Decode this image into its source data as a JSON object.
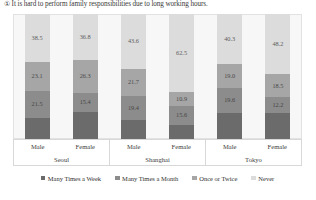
{
  "figure": {
    "title": "① It is hard to perform family responsibilities due to long working hours."
  },
  "legend": {
    "items": [
      {
        "label": "Many Times a Week",
        "color": "#6b6b6b",
        "icon": "square-swatch-icon"
      },
      {
        "label": "Many Times a Month",
        "color": "#8c8c8c",
        "icon": "square-swatch-icon"
      },
      {
        "label": "Once or Twice",
        "color": "#a6a6a6",
        "icon": "square-swatch-icon"
      },
      {
        "label": "Never",
        "color": "#dcdcdc",
        "icon": "square-swatch-icon"
      }
    ]
  },
  "axis": {
    "groups": [
      {
        "city": "Seoul",
        "sexes": [
          "Male",
          "Female"
        ]
      },
      {
        "city": "Shanghai",
        "sexes": [
          "Male",
          "Female"
        ]
      },
      {
        "city": "Tokyo",
        "sexes": [
          "Male",
          "Female"
        ]
      }
    ]
  },
  "chart_data": {
    "type": "bar",
    "title": "① It is hard to perform family responsibilities due to long working hours.",
    "subtype": "100% stacked bar",
    "xlabel": "",
    "ylabel": "",
    "ylim": [
      0,
      100
    ],
    "grid": false,
    "legend_position": "bottom",
    "categories": [
      "Seoul Male",
      "Seoul Female",
      "Shanghai Male",
      "Shanghai Female",
      "Tokyo Male",
      "Tokyo Female"
    ],
    "series": [
      {
        "name": "Many Times a Week",
        "color": "#6b6b6b",
        "values": [
          16.9,
          21.5,
          15.3,
          11.0,
          21.1,
          21.1
        ]
      },
      {
        "name": "Many Times a Month",
        "color": "#8c8c8c",
        "values": [
          21.5,
          15.4,
          19.4,
          15.6,
          19.6,
          12.2
        ]
      },
      {
        "name": "Once or Twice",
        "color": "#a6a6a6",
        "values": [
          23.1,
          26.3,
          21.7,
          10.9,
          19.0,
          18.5
        ]
      },
      {
        "name": "Never",
        "color": "#dcdcdc",
        "values": [
          38.5,
          36.8,
          43.6,
          62.5,
          40.3,
          48.2
        ]
      }
    ],
    "bars": [
      {
        "group": "Seoul",
        "sex": "Male",
        "segments": [
          {
            "label": "Never",
            "value": 38.5,
            "display": "38.5"
          },
          {
            "label": "Once or Twice",
            "value": 23.1,
            "display": "23.1"
          },
          {
            "label": "Many Times a Month",
            "value": 21.5,
            "display": "21.5"
          },
          {
            "label": "Many Times a Week",
            "value": 16.9,
            "display": ""
          }
        ]
      },
      {
        "group": "Seoul",
        "sex": "Female",
        "segments": [
          {
            "label": "Never",
            "value": 36.8,
            "display": "36.8"
          },
          {
            "label": "Once or Twice",
            "value": 26.3,
            "display": "26.3"
          },
          {
            "label": "Many Times a Month",
            "value": 15.4,
            "display": "15.4"
          },
          {
            "label": "Many Times a Week",
            "value": 21.5,
            "display": ""
          }
        ]
      },
      {
        "group": "Shanghai",
        "sex": "Male",
        "segments": [
          {
            "label": "Never",
            "value": 43.6,
            "display": "43.6"
          },
          {
            "label": "Once or Twice",
            "value": 21.7,
            "display": "21.7"
          },
          {
            "label": "Many Times a Month",
            "value": 19.4,
            "display": "19.4"
          },
          {
            "label": "Many Times a Week",
            "value": 15.3,
            "display": ""
          }
        ]
      },
      {
        "group": "Shanghai",
        "sex": "Female",
        "segments": [
          {
            "label": "Never",
            "value": 62.5,
            "display": "62.5"
          },
          {
            "label": "Once or Twice",
            "value": 10.9,
            "display": "10.9"
          },
          {
            "label": "Many Times a Month",
            "value": 15.6,
            "display": "15.6"
          },
          {
            "label": "Many Times a Week",
            "value": 11.0,
            "display": ""
          }
        ]
      },
      {
        "group": "Tokyo",
        "sex": "Male",
        "segments": [
          {
            "label": "Never",
            "value": 40.3,
            "display": "40.3"
          },
          {
            "label": "Once or Twice",
            "value": 19.0,
            "display": "19.0"
          },
          {
            "label": "Many Times a Month",
            "value": 19.6,
            "display": "19.6"
          },
          {
            "label": "Many Times a Week",
            "value": 21.1,
            "display": ""
          }
        ]
      },
      {
        "group": "Tokyo",
        "sex": "Female",
        "segments": [
          {
            "label": "Never",
            "value": 48.2,
            "display": "48.2"
          },
          {
            "label": "Once or Twice",
            "value": 18.5,
            "display": "18.5"
          },
          {
            "label": "Many Times a Month",
            "value": 12.2,
            "display": "12.2"
          },
          {
            "label": "Many Times a Week",
            "value": 21.1,
            "display": ""
          }
        ]
      }
    ]
  }
}
